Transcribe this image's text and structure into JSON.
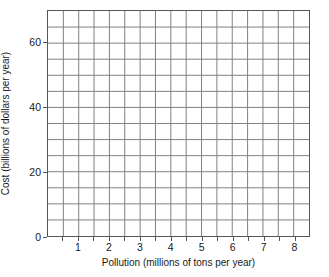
{
  "chart_data": {
    "type": "scatter",
    "title": "",
    "subtitle": "",
    "xlabel": "Pollution (millions of tons per year)",
    "ylabel": "Cost (billions of dollars per year)",
    "xlim": [
      0,
      8.5
    ],
    "ylim": [
      0,
      70
    ],
    "x_major_ticks": [
      1,
      2,
      3,
      4,
      5,
      6,
      7,
      8
    ],
    "x_tick_labels": [
      "1",
      "2",
      "3",
      "4",
      "5",
      "6",
      "7",
      "8"
    ],
    "x_minor_tick_step": 0.5,
    "y_major_ticks": [
      0,
      20,
      40,
      60
    ],
    "y_tick_labels": [
      "0",
      "20",
      "40",
      "60"
    ],
    "y_minor_tick_step": 5,
    "grid": true,
    "grid_color": "#808080",
    "axis_color": "#565656",
    "background_color": "#ffffff",
    "legend": null,
    "legend_position": "none",
    "series": [],
    "values": [],
    "annotations": []
  }
}
